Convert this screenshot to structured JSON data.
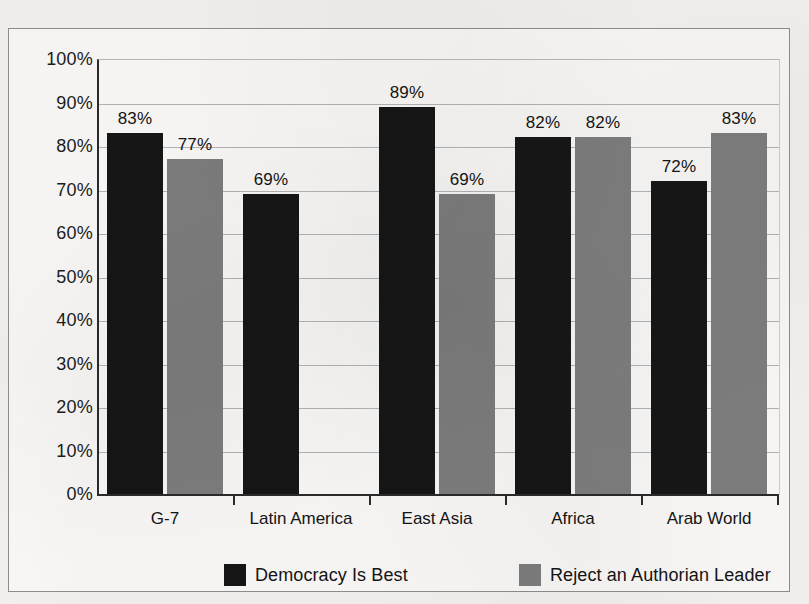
{
  "chart_data": {
    "type": "bar",
    "title": "",
    "subtitle": "",
    "xlabel": "",
    "ylabel": "",
    "ylim": [
      0,
      100
    ],
    "y_tick_labels": [
      "0%",
      "10%",
      "20%",
      "30%",
      "40%",
      "50%",
      "60%",
      "70%",
      "80%",
      "90%",
      "100%"
    ],
    "y_tick_values": [
      0,
      10,
      20,
      30,
      40,
      50,
      60,
      70,
      80,
      90,
      100
    ],
    "grid": "horizontal",
    "legend_position": "bottom",
    "categories": [
      "G-7",
      "Latin America",
      "East Asia",
      "Africa",
      "Arab World"
    ],
    "series": [
      {
        "name": "Democracy Is Best",
        "color": "#161616",
        "values": [
          83,
          69,
          89,
          82,
          72
        ],
        "labels": [
          "83%",
          "69%",
          "89%",
          "82%",
          "72%"
        ]
      },
      {
        "name": "Reject an Authorian Leader",
        "color": "#7e7e7e",
        "values": [
          77,
          null,
          69,
          82,
          83
        ],
        "labels": [
          "77%",
          "",
          "69%",
          "82%",
          "83%"
        ]
      }
    ]
  },
  "legend": {
    "items": [
      {
        "label": "Democracy Is Best",
        "swatch": "dark"
      },
      {
        "label": "Reject an Authorian Leader",
        "swatch": "gray"
      }
    ]
  },
  "colors": {
    "series_dark": "#161616",
    "series_gray": "#7e7e7e",
    "axis": "#2b2b2b",
    "gridline": "#b5b5b5",
    "frame": "#8f8f8f",
    "page_background": "#f4f3f1",
    "plot_background": "#fbfaf8",
    "text": "#141414"
  }
}
